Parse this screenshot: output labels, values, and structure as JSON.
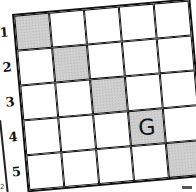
{
  "puzzle": {
    "rows": 5,
    "cols": 5,
    "row_labels": [
      "1",
      "2",
      "3",
      "4",
      "5"
    ],
    "shaded_color": "#cfcfcf",
    "cells": [
      [
        {
          "shaded": true,
          "text": ""
        },
        {
          "shaded": false,
          "text": ""
        },
        {
          "shaded": false,
          "text": ""
        },
        {
          "shaded": false,
          "text": ""
        },
        {
          "shaded": false,
          "text": ""
        }
      ],
      [
        {
          "shaded": false,
          "text": ""
        },
        {
          "shaded": true,
          "text": ""
        },
        {
          "shaded": false,
          "text": ""
        },
        {
          "shaded": false,
          "text": ""
        },
        {
          "shaded": false,
          "text": ""
        }
      ],
      [
        {
          "shaded": false,
          "text": ""
        },
        {
          "shaded": false,
          "text": ""
        },
        {
          "shaded": true,
          "text": ""
        },
        {
          "shaded": false,
          "text": ""
        },
        {
          "shaded": false,
          "text": ""
        }
      ],
      [
        {
          "shaded": false,
          "text": ""
        },
        {
          "shaded": false,
          "text": ""
        },
        {
          "shaded": false,
          "text": ""
        },
        {
          "shaded": true,
          "text": "G"
        },
        {
          "shaded": false,
          "text": ""
        }
      ],
      [
        {
          "shaded": false,
          "text": ""
        },
        {
          "shaded": false,
          "text": ""
        },
        {
          "shaded": false,
          "text": ""
        },
        {
          "shaded": false,
          "text": ""
        },
        {
          "shaded": true,
          "text": ""
        }
      ]
    ]
  },
  "page": {
    "corner_number": "2"
  }
}
